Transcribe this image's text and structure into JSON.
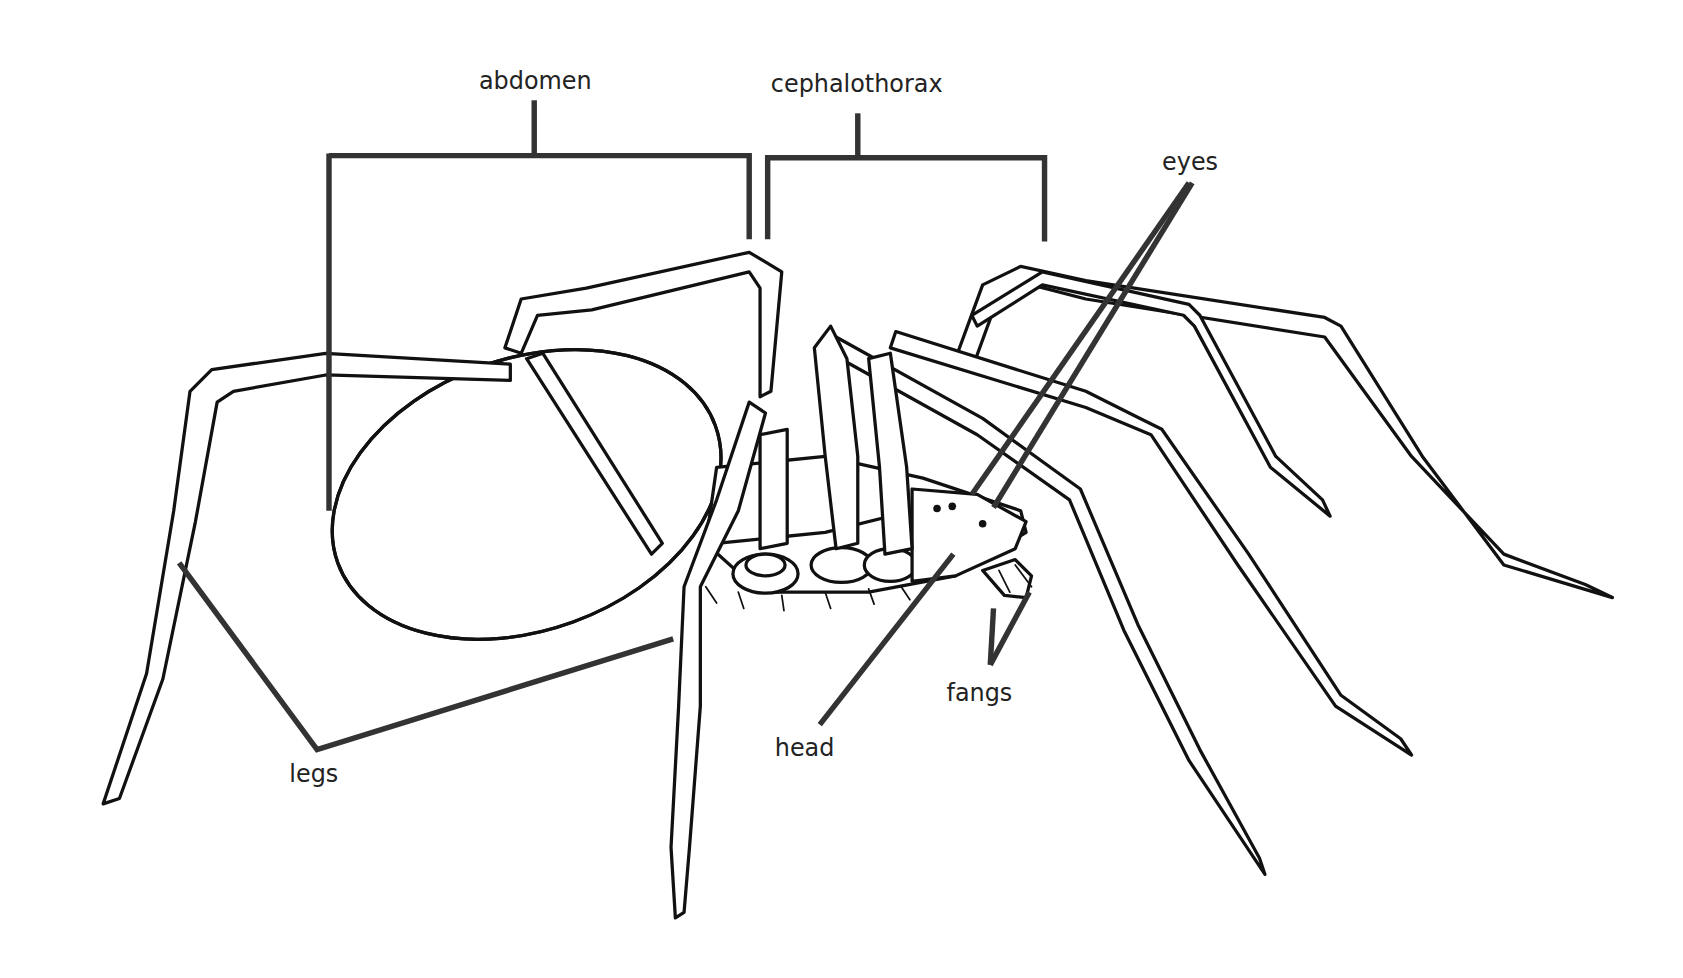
{
  "diagram": {
    "labels": {
      "abdomen": "abdomen",
      "cephalothorax": "cephalothorax",
      "eyes": "eyes",
      "fangs": "fangs",
      "head": "head",
      "legs": "legs"
    },
    "colors": {
      "background": "#ffffff",
      "leader_lines": "#333333",
      "ink": "#111111",
      "text": "#222222"
    }
  }
}
